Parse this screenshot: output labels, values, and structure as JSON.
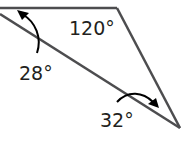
{
  "diagram": {
    "type": "triangle with angle measures",
    "angles": [
      {
        "label": "120°",
        "position": "top-right vertex interior"
      },
      {
        "label": "28°",
        "position": "left vertex, arrow pointing to angle"
      },
      {
        "label": "32°",
        "position": "bottom-right vertex, arrow pointing to angle"
      }
    ],
    "stroke_color": "#4d4d4f",
    "text_color": "#231f20"
  }
}
